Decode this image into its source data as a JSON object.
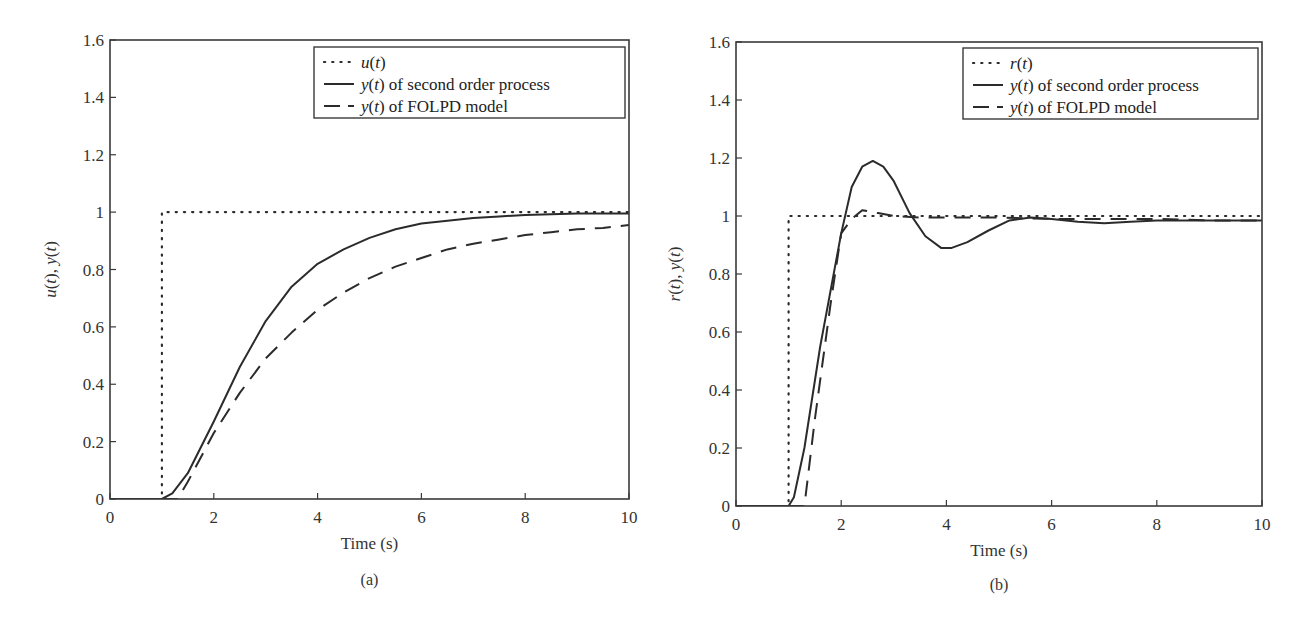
{
  "chart_data": [
    {
      "type": "line",
      "panel_label": "(a)",
      "title": "",
      "xlabel": "Time (s)",
      "ylabel_parts": [
        "u",
        "(",
        "t",
        "), ",
        "y",
        "(",
        "t",
        ")"
      ],
      "ylabel": "u(t), y(t)",
      "xlim": [
        0,
        10
      ],
      "ylim": [
        0,
        1.6
      ],
      "xticks": [
        0,
        2,
        4,
        6,
        8,
        10
      ],
      "xtick_labels": [
        "0",
        "2",
        "4",
        "6",
        "8",
        "10"
      ],
      "yticks": [
        0,
        0.2,
        0.4,
        0.6,
        0.8,
        1,
        1.2,
        1.4,
        1.6
      ],
      "ytick_labels": [
        "0",
        "0.2",
        "0.4",
        "0.6",
        "0.8",
        "1",
        "1.2",
        "1.4",
        "1.6"
      ],
      "grid": false,
      "legend_position": "upper right",
      "series": [
        {
          "name": "u(t)",
          "legend_var": "u(t)",
          "legend_rest": "",
          "style": "dotted",
          "x": [
            0,
            1,
            1,
            10
          ],
          "values": [
            0,
            0,
            1,
            1
          ]
        },
        {
          "name": "y(t) of second order process",
          "legend_var": "y(t)",
          "legend_rest": " of second order process",
          "style": "solid",
          "x": [
            0,
            1.0,
            1.2,
            1.5,
            2.0,
            2.5,
            3.0,
            3.5,
            4.0,
            4.5,
            5.0,
            5.5,
            6.0,
            6.5,
            7.0,
            7.5,
            8.0,
            9.0,
            10.0
          ],
          "values": [
            0,
            0,
            0.02,
            0.09,
            0.27,
            0.46,
            0.62,
            0.74,
            0.82,
            0.87,
            0.91,
            0.94,
            0.96,
            0.97,
            0.98,
            0.985,
            0.99,
            0.995,
            0.995
          ]
        },
        {
          "name": "y(t) of FOLPD model",
          "legend_var": "y(t)",
          "legend_rest": " of FOLPD model",
          "style": "dashed",
          "x": [
            0,
            1.3,
            1.5,
            2.0,
            2.5,
            3.0,
            3.5,
            4.0,
            4.5,
            5.0,
            5.5,
            6.0,
            6.5,
            7.0,
            7.5,
            8.0,
            8.5,
            9.0,
            9.5,
            10.0
          ],
          "values": [
            0,
            0,
            0.06,
            0.23,
            0.37,
            0.49,
            0.58,
            0.66,
            0.72,
            0.77,
            0.81,
            0.84,
            0.87,
            0.89,
            0.905,
            0.92,
            0.93,
            0.94,
            0.945,
            0.955
          ]
        }
      ]
    },
    {
      "type": "line",
      "panel_label": "(b)",
      "title": "",
      "xlabel": "Time (s)",
      "ylabel_parts": [
        "r",
        "(",
        "t",
        "), ",
        "y",
        "(",
        "t",
        ")"
      ],
      "ylabel": "r(t), y(t)",
      "xlim": [
        0,
        10
      ],
      "ylim": [
        0,
        1.6
      ],
      "xticks": [
        0,
        2,
        4,
        6,
        8,
        10
      ],
      "xtick_labels": [
        "0",
        "2",
        "4",
        "6",
        "8",
        "10"
      ],
      "yticks": [
        0,
        0.2,
        0.4,
        0.6,
        0.8,
        1,
        1.2,
        1.4,
        1.6
      ],
      "ytick_labels": [
        "0",
        "0.2",
        "0.4",
        "0.6",
        "0.8",
        "1",
        "1.2",
        "1.4",
        "1.6"
      ],
      "grid": false,
      "legend_position": "upper right",
      "series": [
        {
          "name": "r(t)",
          "legend_var": "r(t)",
          "legend_rest": "",
          "style": "dotted",
          "x": [
            0,
            1,
            1,
            10
          ],
          "values": [
            0,
            0,
            1,
            1
          ]
        },
        {
          "name": "y(t) of second order process",
          "legend_var": "y(t)",
          "legend_rest": " of second order process",
          "style": "solid",
          "x": [
            0,
            1.0,
            1.1,
            1.3,
            1.6,
            2.0,
            2.2,
            2.4,
            2.6,
            2.8,
            3.0,
            3.3,
            3.6,
            3.9,
            4.1,
            4.4,
            4.8,
            5.2,
            5.6,
            6.0,
            6.5,
            7.0,
            7.5,
            8.0,
            9.0,
            10.0
          ],
          "values": [
            0,
            0,
            0.03,
            0.2,
            0.55,
            0.94,
            1.1,
            1.17,
            1.19,
            1.17,
            1.12,
            1.01,
            0.93,
            0.89,
            0.89,
            0.91,
            0.95,
            0.985,
            0.995,
            0.99,
            0.98,
            0.975,
            0.98,
            0.985,
            0.985,
            0.985
          ]
        },
        {
          "name": "y(t) of FOLPD model",
          "legend_var": "y(t)",
          "legend_rest": " of FOLPD model",
          "style": "dashed",
          "x": [
            0,
            1.3,
            1.5,
            1.8,
            2.0,
            2.2,
            2.4,
            2.7,
            3.0,
            3.5,
            4.0,
            5.0,
            6.0,
            7.0,
            8.0,
            9.0,
            10.0
          ],
          "values": [
            0,
            0,
            0.3,
            0.7,
            0.94,
            0.99,
            1.02,
            1.01,
            1.0,
            0.995,
            0.995,
            0.995,
            0.99,
            0.99,
            0.99,
            0.985,
            0.985
          ]
        }
      ]
    }
  ],
  "colors": {
    "line": "#2b2b2b",
    "axis": "#3a3a3a",
    "background": "#ffffff"
  }
}
